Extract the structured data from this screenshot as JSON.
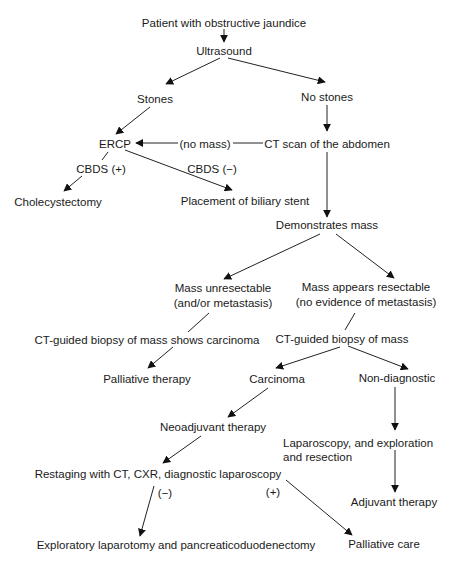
{
  "diagram": {
    "type": "flowchart",
    "nodes": {
      "start": "Patient with obstructive jaundice",
      "ultrasound": "Ultrasound",
      "stones": "Stones",
      "no_stones": "No stones",
      "ercp": "ERCP",
      "ct_scan": "CT scan of the abdomen",
      "cholecystectomy": "Cholecystectomy",
      "biliary_stent": "Placement of biliary stent",
      "demonstrates_mass": "Demonstrates mass",
      "mass_unresectable_1": "Mass unresectable",
      "mass_unresectable_2": "(and/or metastasis)",
      "mass_resectable_1": "Mass appears resectable",
      "mass_resectable_2": "(no evidence of metastasis)",
      "biopsy_carcinoma": "CT-guided biopsy of mass shows carcinoma",
      "biopsy_mass": "CT-guided biopsy of mass",
      "palliative_therapy": "Palliative therapy",
      "carcinoma": "Carcinoma",
      "non_diagnostic": "Non-diagnostic",
      "neoadjuvant": "Neoadjuvant therapy",
      "laparoscopy_1": "Laparoscopy, and exploration",
      "laparoscopy_2": "and resection",
      "restaging": "Restaging with CT, CXR, diagnostic laparoscopy",
      "adjuvant": "Adjuvant therapy",
      "exploratory": "Exploratory laparotomy and pancreaticoduodenectomy",
      "palliative_care": "Palliative care"
    },
    "edge_labels": {
      "no_mass": "(no mass)",
      "cbds_pos": "CBDS (+)",
      "cbds_neg": "CBDS (−)",
      "restage_neg": "(−)",
      "restage_pos": "(+)"
    },
    "edges": [
      {
        "from": "start",
        "to": "ultrasound"
      },
      {
        "from": "ultrasound",
        "to": "stones"
      },
      {
        "from": "ultrasound",
        "to": "no_stones"
      },
      {
        "from": "stones",
        "to": "ercp"
      },
      {
        "from": "no_stones",
        "to": "ct_scan"
      },
      {
        "from": "ct_scan",
        "to": "ercp",
        "label": "(no mass)"
      },
      {
        "from": "ercp",
        "to": "cholecystectomy",
        "label": "CBDS (+)"
      },
      {
        "from": "ercp",
        "to": "biliary_stent",
        "label": "CBDS (−)"
      },
      {
        "from": "ct_scan",
        "to": "demonstrates_mass"
      },
      {
        "from": "demonstrates_mass",
        "to": "mass_unresectable"
      },
      {
        "from": "demonstrates_mass",
        "to": "mass_resectable"
      },
      {
        "from": "mass_unresectable",
        "to": "biopsy_carcinoma"
      },
      {
        "from": "biopsy_carcinoma",
        "to": "palliative_therapy"
      },
      {
        "from": "mass_resectable",
        "to": "biopsy_mass"
      },
      {
        "from": "biopsy_mass",
        "to": "carcinoma"
      },
      {
        "from": "biopsy_mass",
        "to": "non_diagnostic"
      },
      {
        "from": "carcinoma",
        "to": "neoadjuvant"
      },
      {
        "from": "neoadjuvant",
        "to": "restaging"
      },
      {
        "from": "restaging",
        "to": "exploratory",
        "label": "(−)"
      },
      {
        "from": "restaging",
        "to": "palliative_care",
        "label": "(+)"
      },
      {
        "from": "non_diagnostic",
        "to": "laparoscopy"
      },
      {
        "from": "laparoscopy",
        "to": "adjuvant"
      }
    ]
  },
  "page_fragment": "tients with th"
}
